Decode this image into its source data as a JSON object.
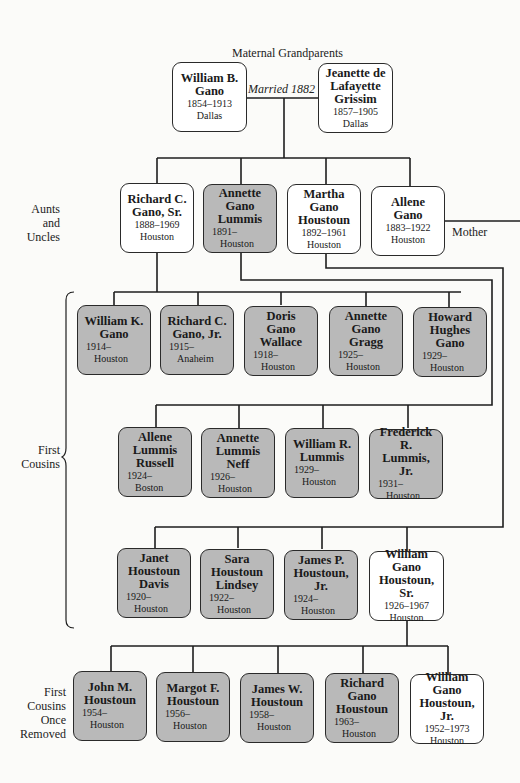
{
  "header": {
    "title": "Maternal Grandparents",
    "married_label": "Married 1882"
  },
  "grandparents": [
    {
      "name": [
        "William B.",
        "Gano"
      ],
      "years": "1854–1913",
      "place": "Dallas",
      "style": "white"
    },
    {
      "name": [
        "Jeanette de",
        "Lafayette",
        "Grissim"
      ],
      "years": "1857–1905",
      "place": "Dallas",
      "style": "white"
    }
  ],
  "labels": {
    "aunts_uncles": [
      "Aunts",
      "and",
      "Uncles"
    ],
    "first_cousins": [
      "First",
      "Cousins"
    ],
    "once_removed": [
      "First",
      "Cousins",
      "Once",
      "Removed"
    ],
    "mother": "Mother"
  },
  "aunts_uncles": [
    {
      "name": [
        "Richard C.",
        "Gano, Sr."
      ],
      "years": "1888–1969",
      "place": "Houston",
      "style": "white"
    },
    {
      "name": [
        "Annette",
        "Gano",
        "Lummis"
      ],
      "years": "1891–",
      "place": "Houston",
      "style": "gray"
    },
    {
      "name": [
        "Martha",
        "Gano",
        "Houstoun"
      ],
      "years": "1892–1961",
      "place": "Houston",
      "style": "white"
    },
    {
      "name": [
        "Allene",
        "Gano"
      ],
      "years": "1883–1922",
      "place": "Houston",
      "style": "white"
    }
  ],
  "cousins_gano": [
    {
      "name": [
        "William K.",
        "Gano"
      ],
      "years": "1914–",
      "place": "Houston",
      "style": "gray"
    },
    {
      "name": [
        "Richard C.",
        "Gano, Jr."
      ],
      "years": "1915–",
      "place": "Anaheim",
      "style": "gray"
    },
    {
      "name": [
        "Doris",
        "Gano",
        "Wallace"
      ],
      "years": "1918–",
      "place": "Houston",
      "style": "gray"
    },
    {
      "name": [
        "Annette",
        "Gano",
        "Gragg"
      ],
      "years": "1925–",
      "place": "Houston",
      "style": "gray"
    },
    {
      "name": [
        "Howard",
        "Hughes",
        "Gano"
      ],
      "years": "1929–",
      "place": "Houston",
      "style": "gray"
    }
  ],
  "cousins_lummis": [
    {
      "name": [
        "Allene",
        "Lummis",
        "Russell"
      ],
      "years": "1924–",
      "place": "Boston",
      "style": "gray"
    },
    {
      "name": [
        "Annette",
        "Lummis",
        "Neff"
      ],
      "years": "1926–",
      "place": "Houston",
      "style": "gray"
    },
    {
      "name": [
        "William R.",
        "Lummis"
      ],
      "years": "1929–",
      "place": "Houston",
      "style": "gray"
    },
    {
      "name": [
        "Frederick R.",
        "Lummis, Jr."
      ],
      "years": "1931–",
      "place": "Houston",
      "style": "gray"
    }
  ],
  "cousins_houstoun": [
    {
      "name": [
        "Janet",
        "Houstoun",
        "Davis"
      ],
      "years": "1920–",
      "place": "Houston",
      "style": "gray"
    },
    {
      "name": [
        "Sara",
        "Houstoun",
        "Lindsey"
      ],
      "years": "1922–",
      "place": "Houston",
      "style": "gray"
    },
    {
      "name": [
        "James P.",
        "Houstoun,",
        "Jr."
      ],
      "years": "1924–",
      "place": "Houston",
      "style": "gray"
    },
    {
      "name": [
        "William",
        "Gano",
        "Houstoun, Sr."
      ],
      "years": "1926–1967",
      "place": "Houston",
      "style": "white"
    }
  ],
  "once_removed": [
    {
      "name": [
        "John M.",
        "Houstoun"
      ],
      "years": "1954–",
      "place": "Houston",
      "style": "gray"
    },
    {
      "name": [
        "Margot F.",
        "Houstoun"
      ],
      "years": "1956–",
      "place": "Houston",
      "style": "gray"
    },
    {
      "name": [
        "James W.",
        "Houstoun"
      ],
      "years": "1958–",
      "place": "Houston",
      "style": "gray"
    },
    {
      "name": [
        "Richard",
        "Gano",
        "Houstoun"
      ],
      "years": "1963–",
      "place": "Houston",
      "style": "gray"
    },
    {
      "name": [
        "William",
        "Gano",
        "Houstoun, Jr."
      ],
      "years": "1952–1973",
      "place": "Houston",
      "style": "white"
    }
  ],
  "colors": {
    "gray_fill": "#b9b9b9",
    "white_fill": "#ffffff",
    "line": "#1e1e1e"
  }
}
